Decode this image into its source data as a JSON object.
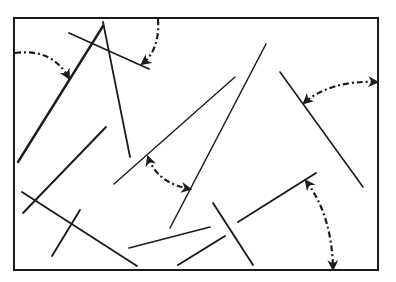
{
  "diagram": {
    "title": "",
    "colors": {
      "line": "#1c1c1c",
      "background": "#ffffff",
      "frame": "#1a1a1a"
    },
    "frame": {
      "x1": 14,
      "y1": 18,
      "x2": 378,
      "y2": 270
    },
    "segments": [
      {
        "id": "a",
        "x1": 103,
        "y1": 26,
        "x2": 18,
        "y2": 162,
        "width": 2.4
      },
      {
        "id": "b",
        "x1": 103,
        "y1": 22,
        "x2": 130,
        "y2": 157,
        "width": 1.8
      },
      {
        "id": "c",
        "x1": 69,
        "y1": 33,
        "x2": 149,
        "y2": 69,
        "width": 1.8
      },
      {
        "id": "d",
        "x1": 106,
        "y1": 127,
        "x2": 23,
        "y2": 213,
        "width": 2.0
      },
      {
        "id": "e",
        "x1": 22,
        "y1": 192,
        "x2": 137,
        "y2": 266,
        "width": 1.9
      },
      {
        "id": "f",
        "x1": 80,
        "y1": 210,
        "x2": 52,
        "y2": 256,
        "width": 1.9
      },
      {
        "id": "g",
        "x1": 235,
        "y1": 77,
        "x2": 114,
        "y2": 184,
        "width": 1.4
      },
      {
        "id": "h",
        "x1": 266,
        "y1": 44,
        "x2": 170,
        "y2": 228,
        "width": 1.5
      },
      {
        "id": "i",
        "x1": 280,
        "y1": 72,
        "x2": 363,
        "y2": 187,
        "width": 1.6
      },
      {
        "id": "j",
        "x1": 129,
        "y1": 248,
        "x2": 210,
        "y2": 227,
        "width": 1.7
      },
      {
        "id": "k",
        "x1": 178,
        "y1": 265,
        "x2": 225,
        "y2": 236,
        "width": 2.0
      },
      {
        "id": "l",
        "x1": 213,
        "y1": 203,
        "x2": 253,
        "y2": 265,
        "width": 1.9
      },
      {
        "id": "m",
        "x1": 238,
        "y1": 222,
        "x2": 316,
        "y2": 173,
        "width": 1.9
      }
    ],
    "angle_arrows": [
      {
        "id": "arc-top-left",
        "path": "M 15 53 Q 52 48 69 78",
        "heads": [
          "end"
        ]
      },
      {
        "id": "arc-top",
        "path": "M 158 19 Q 160 50 142 64",
        "heads": [
          "end"
        ]
      },
      {
        "id": "arc-right",
        "path": "M 377 82 Q 330 80 304 103",
        "heads": [
          "start",
          "end"
        ]
      },
      {
        "id": "arc-middle",
        "path": "M 148 157 Q 157 183 190 189",
        "heads": [
          "start",
          "end"
        ]
      },
      {
        "id": "arc-bottom-right",
        "path": "M 306 181 Q 332 215 333 269",
        "heads": [
          "start",
          "end"
        ]
      }
    ]
  }
}
